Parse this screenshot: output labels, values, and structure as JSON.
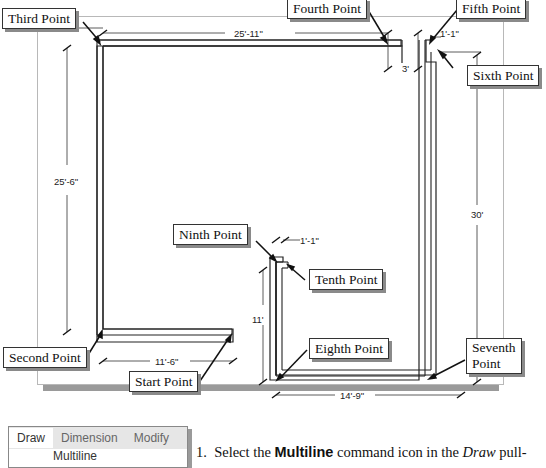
{
  "callouts": {
    "start": "Start Point",
    "second": "Second Point",
    "third": "Third Point",
    "fourth": "Fourth Point",
    "fifth": "Fifth Point",
    "sixth": "Sixth Point",
    "seventh_line1": "Seventh",
    "seventh_line2": "Point",
    "eighth": "Eighth Point",
    "ninth": "Ninth Point",
    "tenth": "Tenth Point"
  },
  "dimensions": {
    "top_width": "25'-11\"",
    "left_height": "25'-6\"",
    "right_height": "30'",
    "gap_top": "1'-1\"",
    "gap_depth": "3'",
    "inner_gap": "1'-1\"",
    "inner_height": "11'",
    "bottom_left": "11'-6\"",
    "bottom_right": "14'-9\""
  },
  "menu": {
    "tabs": [
      "Draw",
      "Dimension",
      "Modify"
    ],
    "active_tab": "Draw",
    "first_item": "Multiline"
  },
  "instruction": {
    "number": "1.",
    "text_before": "Select the ",
    "bold": "Multiline",
    "text_after": " command icon in the ",
    "italic": "Draw",
    "text_end": " pull-"
  }
}
